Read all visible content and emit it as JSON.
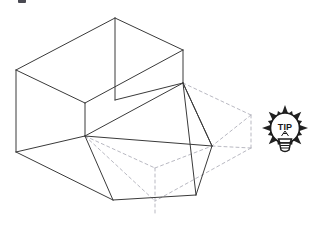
{
  "figure": {
    "kind": "isometric-line-drawing",
    "background_color": "#ffffff",
    "solid_line_color": "#3a3a3a",
    "dashed_line_color": "#b9b9c2",
    "solid_line_width": 1,
    "dashed_line_width": 1,
    "dash_pattern": "3,3",
    "solid_edges": [
      {
        "name": "top-rear-left-ridge",
        "points": "16,70 115,18"
      },
      {
        "name": "top-rear-right-ridge",
        "points": "115,18 183,50"
      },
      {
        "name": "top-front-right-ridge",
        "points": "183,50 85,103"
      },
      {
        "name": "top-front-left-ridge",
        "points": "85,103 16,70"
      },
      {
        "name": "left-vertical-edge",
        "points": "16,70 16,152"
      },
      {
        "name": "center-vertical-edge",
        "points": "115,18 115,100"
      },
      {
        "name": "right-vertical-edge",
        "points": "183,50 183,83"
      },
      {
        "name": "inner-corner-vertical",
        "points": "85,103 85,136"
      },
      {
        "name": "ledge-rear-left",
        "points": "16,152 85,136"
      },
      {
        "name": "ledge-top-run",
        "points": "85,136 183,83"
      },
      {
        "name": "upper-slant-to-apex",
        "points": "115,100 183,83"
      },
      {
        "name": "lower-long-slant",
        "points": "16,152 113,200"
      },
      {
        "name": "cut-face-left",
        "points": "85,136 113,200"
      },
      {
        "name": "cut-face-bottom",
        "points": "113,200 196,195"
      },
      {
        "name": "cut-face-right-lower",
        "points": "196,195 212,146"
      },
      {
        "name": "cut-face-right-upper",
        "points": "212,146 183,83"
      },
      {
        "name": "cut-face-diagonal-a",
        "points": "183,83 212,146"
      },
      {
        "name": "cut-face-diagonal-b",
        "points": "183,83 196,195"
      },
      {
        "name": "ledge-to-right-corner",
        "points": "85,136 212,146"
      }
    ],
    "dashed_edges": [
      {
        "name": "hidden-box-top-rear",
        "points": "183,83 251,115"
      },
      {
        "name": "hidden-box-right-vertical",
        "points": "251,115 251,148"
      },
      {
        "name": "hidden-box-front-upper",
        "points": "251,115 212,146"
      },
      {
        "name": "hidden-box-front-lower",
        "points": "212,146 251,148"
      },
      {
        "name": "hidden-box-bottom-run",
        "points": "251,148 155,201"
      },
      {
        "name": "hidden-box-left-slant",
        "points": "85,136 155,201"
      },
      {
        "name": "hidden-box-center-vertical",
        "points": "155,168 155,214"
      },
      {
        "name": "hidden-box-inner-slant",
        "points": "85,136 155,168"
      },
      {
        "name": "hidden-box-inner-slant-right",
        "points": "155,168 212,146"
      }
    ]
  },
  "tip_badge": {
    "label": "TIP",
    "icon_name": "lightbulb-tip-icon",
    "ray_count": 16,
    "bulb_color": "#ffffff",
    "outline_color": "#222222",
    "center_x": 285,
    "center_y": 130
  }
}
